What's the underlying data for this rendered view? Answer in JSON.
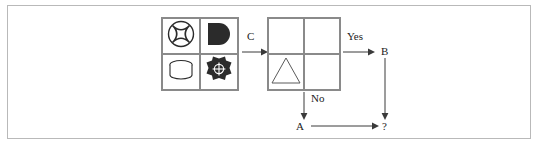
{
  "diagram": {
    "type": "flowchart",
    "icon_grid": {
      "name": "icon-grid",
      "rows": 2,
      "cols": 2,
      "cells": [
        {
          "position": "top-left",
          "icon": "circle-x-icon",
          "fill": "outline",
          "color": "#2b2b2b"
        },
        {
          "position": "top-right",
          "icon": "half-disc-icon",
          "fill": "solid",
          "color": "#2b2b2b"
        },
        {
          "position": "bottom-left",
          "icon": "cylinder-icon",
          "fill": "outline",
          "color": "#2b2b2b"
        },
        {
          "position": "bottom-right",
          "icon": "gear-target-icon",
          "fill": "solid",
          "color": "#2b2b2b"
        }
      ]
    },
    "shape_grid": {
      "name": "shape-grid",
      "rows": 2,
      "cols": 2,
      "cells": [
        {
          "position": "top-left",
          "icon": ""
        },
        {
          "position": "top-right",
          "icon": ""
        },
        {
          "position": "bottom-left",
          "icon": "triangle-icon"
        },
        {
          "position": "bottom-right",
          "icon": ""
        }
      ]
    },
    "edges": [
      {
        "id": "edge-c",
        "label": "C",
        "direction": "right"
      },
      {
        "id": "edge-yes",
        "label": "Yes",
        "direction": "right"
      },
      {
        "id": "edge-no",
        "label": "No",
        "direction": "down"
      },
      {
        "id": "edge-b-to-q",
        "label": "",
        "direction": "down"
      },
      {
        "id": "edge-a-to-q",
        "label": "",
        "direction": "right"
      }
    ],
    "nodes": [
      {
        "id": "node-b",
        "label": "B"
      },
      {
        "id": "node-a",
        "label": "A"
      },
      {
        "id": "node-question",
        "label": "?"
      }
    ],
    "colors": {
      "frame_border": "#b9b9b9",
      "grid_border": "#8a8a8a",
      "arrow": "#3a3a3a",
      "text": "#1c1c1c",
      "background": "#ffffff"
    }
  }
}
